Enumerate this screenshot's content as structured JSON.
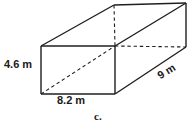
{
  "figure": {
    "name": "rectangular-prism",
    "part_label": "c.",
    "stroke_color": "#1f1f1f",
    "background_color": "#ffffff",
    "labels": {
      "height": "4.6 m",
      "width": "8.2 m",
      "depth": "9 m"
    },
    "dimensions": {
      "height_value": 4.6,
      "width_value": 8.2,
      "depth_value": 9,
      "unit": "m"
    },
    "vertices": {
      "front_top_left": [
        41,
        46
      ],
      "front_top_right": [
        115,
        46
      ],
      "front_bottom_left": [
        41,
        94
      ],
      "front_bottom_right": [
        115,
        94
      ],
      "back_top_left": [
        114,
        5
      ],
      "back_top_right": [
        186,
        3
      ],
      "back_bottom_left": [
        115,
        46
      ],
      "back_bottom_right": [
        186,
        47
      ]
    },
    "edge_styles": {
      "visible": "solid",
      "hidden": "dashed"
    }
  }
}
